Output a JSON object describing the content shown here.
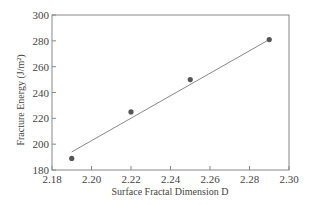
{
  "chart_data": {
    "type": "scatter",
    "title": "",
    "xlabel": "Surface Fractal Dimension D",
    "ylabel": "Fracture Energy (J/m²)",
    "xlim": [
      2.18,
      2.3
    ],
    "ylim": [
      180,
      300
    ],
    "x_ticks": [
      "2.18",
      "2.20",
      "2.22",
      "2.24",
      "2.26",
      "2.28",
      "2.30"
    ],
    "y_ticks": [
      "180",
      "200",
      "220",
      "240",
      "260",
      "280",
      "300"
    ],
    "grid": false,
    "legend": null,
    "series": [
      {
        "name": "measured",
        "type": "scatter",
        "x": [
          2.19,
          2.22,
          2.25,
          2.29
        ],
        "y": [
          189,
          225,
          250,
          281
        ]
      },
      {
        "name": "linear fit",
        "type": "line",
        "x": [
          2.19,
          2.29
        ],
        "y": [
          194,
          281
        ]
      }
    ],
    "colors": {
      "marker": "#555555",
      "line": "#888888",
      "axis": "#888888"
    }
  }
}
